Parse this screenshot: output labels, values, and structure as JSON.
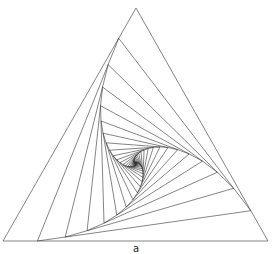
{
  "diagram": {
    "type": "nested-rotating-triangles",
    "outer_triangle": [
      [
        136,
        8
      ],
      [
        3,
        241
      ],
      [
        268,
        241
      ]
    ],
    "step_fraction": 0.13,
    "iterations": 70,
    "stroke_color": "#333333",
    "stroke_width": 0.6,
    "background": "#ffffff"
  },
  "caption": "a"
}
